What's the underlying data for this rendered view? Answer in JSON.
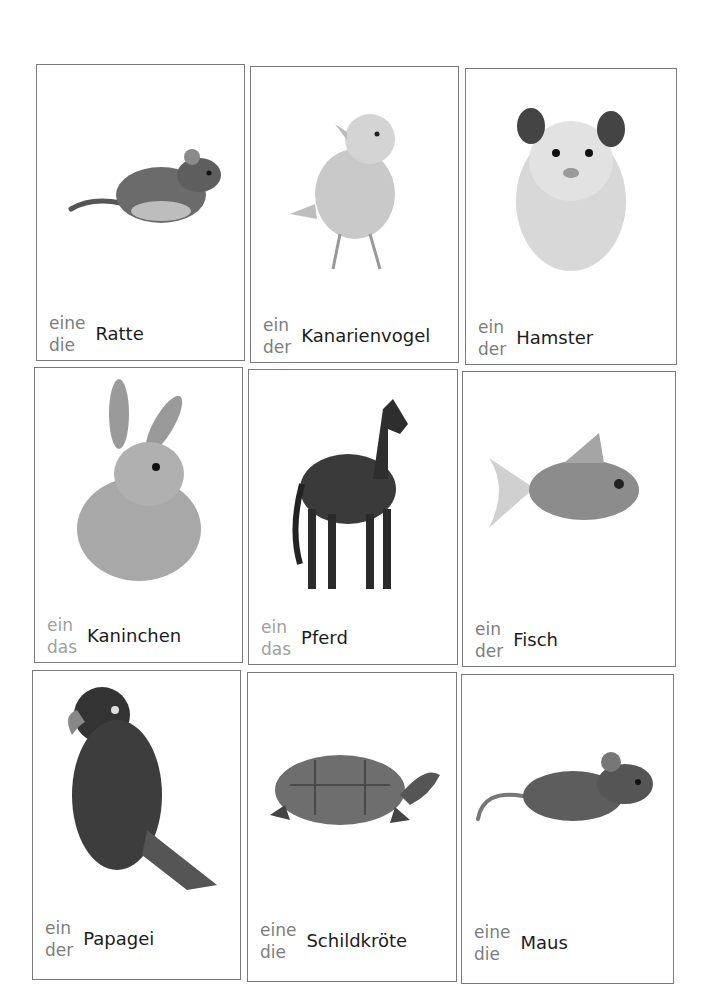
{
  "page": {
    "layout": "3x3 flashcard grid",
    "colors": {
      "border": "#7a7a7a",
      "article": "#7d7d7d",
      "article_light": "#a0a0a0",
      "noun": "#1c1c1c"
    }
  },
  "cards": [
    {
      "animal_icon": "rat-icon",
      "indefinite": "eine",
      "definite": "die",
      "noun": "Ratte"
    },
    {
      "animal_icon": "canary-icon",
      "indefinite": "ein",
      "definite": "der",
      "noun": "Kanarienvogel"
    },
    {
      "animal_icon": "hamster-icon",
      "indefinite": "ein",
      "definite": "der",
      "noun": "Hamster"
    },
    {
      "animal_icon": "rabbit-icon",
      "indefinite": "ein",
      "definite": "das",
      "noun": "Kaninchen"
    },
    {
      "animal_icon": "horse-icon",
      "indefinite": "ein",
      "definite": "das",
      "noun": "Pferd"
    },
    {
      "animal_icon": "goldfish-icon",
      "indefinite": "ein",
      "definite": "der",
      "noun": "Fisch"
    },
    {
      "animal_icon": "parrot-icon",
      "indefinite": "ein",
      "definite": "der",
      "noun": "Papagei"
    },
    {
      "animal_icon": "turtle-icon",
      "indefinite": "eine",
      "definite": "die",
      "noun": "Schildkröte"
    },
    {
      "animal_icon": "mouse-icon",
      "indefinite": "eine",
      "definite": "die",
      "noun": "Maus"
    }
  ]
}
